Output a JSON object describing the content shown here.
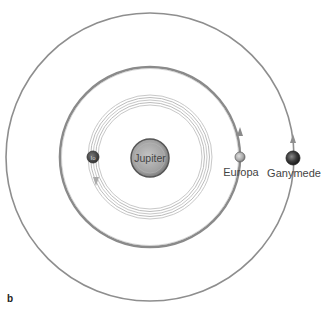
{
  "figure": {
    "panel_label": "b",
    "center": {
      "name": "Jupiter",
      "label": "Jupiter"
    },
    "moons": [
      {
        "name": "Io",
        "label": "Io",
        "orbit": "inner"
      },
      {
        "name": "Europa",
        "label": "Europa",
        "orbit": "middle"
      },
      {
        "name": "Ganymede",
        "label": "Ganymede",
        "orbit": "outer"
      }
    ]
  }
}
